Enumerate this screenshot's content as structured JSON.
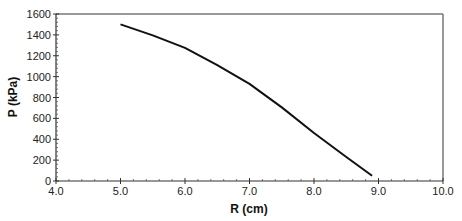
{
  "chart_data": {
    "type": "line",
    "title": "",
    "xlabel": "R (cm)",
    "ylabel": "P (kPa)",
    "xlim": [
      4.0,
      10.0
    ],
    "ylim": [
      0,
      1600
    ],
    "x_ticks": [
      "4.0",
      "5.0",
      "6.0",
      "7.0",
      "8.0",
      "9.0",
      "10.0"
    ],
    "y_ticks": [
      "0",
      "200",
      "400",
      "600",
      "800",
      "1000",
      "1200",
      "1400",
      "1600"
    ],
    "grid": false,
    "legend": null,
    "series": [
      {
        "name": "P vs R",
        "color": "#111111",
        "x": [
          5.0,
          5.5,
          6.0,
          6.5,
          7.0,
          7.5,
          8.0,
          8.5,
          8.9
        ],
        "y": [
          1500,
          1395,
          1275,
          1110,
          930,
          705,
          460,
          230,
          50
        ]
      }
    ]
  }
}
